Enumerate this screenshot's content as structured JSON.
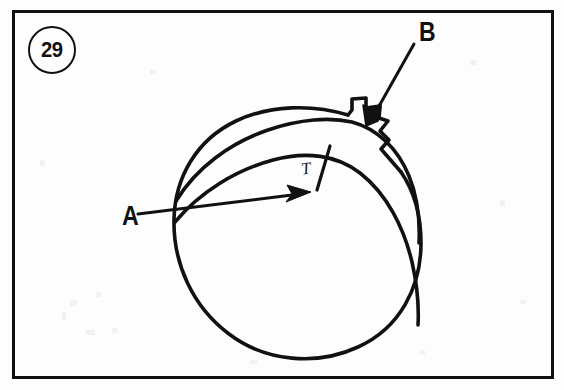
{
  "figure": {
    "number": "29",
    "kind": "technical-line-drawing",
    "background_color": "#fdfdfd",
    "ink_color": "#111111",
    "frame": {
      "name": "figure-border",
      "x": 12,
      "y": 10,
      "width": 541,
      "height": 368,
      "stroke_width": 3
    }
  },
  "labels": {
    "a": {
      "text": "A",
      "x": 122,
      "y": 203,
      "leader": "arrow pointing up-right to seam intersection"
    },
    "b": {
      "text": "B",
      "x": 419,
      "y": 18,
      "leader": "arrow pointing down-left to stepped cap"
    },
    "t": {
      "text": "T",
      "x": 300,
      "y": 161,
      "leader": "none"
    }
  },
  "shapes": {
    "sphere": {
      "name": "ball-outline",
      "cx": 297,
      "cy": 233,
      "r": 124
    },
    "cap": {
      "name": "stepped-cap",
      "description": "notched bracket profile at upper right of ball"
    },
    "bands": [
      {
        "name": "seam-band-upper",
        "description": "wide curved band sweeping from upper-left to right edge"
      },
      {
        "name": "seam-band-lower",
        "description": "narrow curved seam below the upper band"
      },
      {
        "name": "band-tick",
        "description": "short cross line marking band width near label T"
      }
    ]
  },
  "colors": {
    "ink": "#111111",
    "paper": "#fdfdfd"
  }
}
